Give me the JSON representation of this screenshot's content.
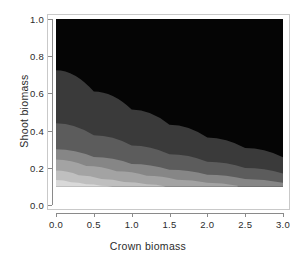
{
  "figure": {
    "background": "#ffffff",
    "panel_border_color": "#c9c9c9",
    "axis_color": "#8a8a8a",
    "text_color": "#2b2b2b"
  },
  "axes": {
    "x": {
      "title": "Crown biomass",
      "ticks": [
        "0.0",
        "0.5",
        "1.0",
        "1.5",
        "2.0",
        "2.5",
        "3.0"
      ],
      "tick_values": [
        0.0,
        0.5,
        1.0,
        1.5,
        2.0,
        2.5,
        3.0
      ],
      "range": [
        0.0,
        3.0
      ]
    },
    "y": {
      "title": "Shoot biomass",
      "ticks": [
        "0.0",
        "0.2",
        "0.4",
        "0.6",
        "0.8",
        "1.0"
      ],
      "tick_values": [
        0.0,
        0.2,
        0.4,
        0.6,
        0.8,
        1.0
      ],
      "range": [
        0.0,
        1.0
      ]
    }
  },
  "chart_data": {
    "type": "heatmap",
    "title": "",
    "xlabel": "Crown biomass",
    "ylabel": "Shoot biomass",
    "xlim": [
      0.0,
      3.0
    ],
    "ylim": [
      0.0,
      1.0
    ],
    "grid": false,
    "legend": "none",
    "colormap": "grayscale",
    "colormap_direction": "light-low-left to black-high-right",
    "data_extent": {
      "x": [
        0.0,
        3.0
      ],
      "y": [
        0.1,
        1.0
      ],
      "note": "shaded image region does not reach y=0; blank white strip below y=0.1"
    },
    "contour_levels": [
      {
        "index": 0,
        "color": "#d9d9d9",
        "label": "lightest band (lower-left corner)"
      },
      {
        "index": 1,
        "color": "#bfbfbf",
        "label": "light gray band"
      },
      {
        "index": 2,
        "color": "#a3a3a3",
        "label": "medium-light gray band"
      },
      {
        "index": 3,
        "color": "#868686",
        "label": "medium gray band"
      },
      {
        "index": 4,
        "color": "#5c5c5c",
        "label": "dark gray band"
      },
      {
        "index": 5,
        "color": "#3a3a3a",
        "label": "darker gray band"
      },
      {
        "index": 6,
        "color": "#050505",
        "label": "black region (upper right, dominant)"
      }
    ],
    "band_boundaries_hyperbolic": [
      {
        "level": 0,
        "k": 0.022,
        "y_at_x0": 0.135,
        "description": "boundary between lightest and next band"
      },
      {
        "level": 1,
        "k": 0.06,
        "y_at_x0": 0.185,
        "description": "boundary of light gray band"
      },
      {
        "level": 2,
        "k": 0.135,
        "y_at_x0": 0.245,
        "description": "boundary of medium-light band"
      },
      {
        "level": 3,
        "k": 0.27,
        "y_at_x0": 0.3,
        "description": "boundary of medium gray band"
      },
      {
        "level": 4,
        "k": 0.6,
        "y_at_x0": 0.44,
        "description": "boundary of dark gray band"
      },
      {
        "level": 5,
        "k": 1.25,
        "y_at_x0": 0.725,
        "description": "boundary of darker gray band into black"
      }
    ],
    "boundary_samples": {
      "description": "approximate (x,y) points tracing each band boundary from left edge to where it exits the panel",
      "level_0": [
        [
          0.0,
          0.135
        ],
        [
          0.2,
          0.122
        ],
        [
          0.4,
          0.112
        ],
        [
          0.6,
          0.104
        ],
        [
          0.75,
          0.1
        ]
      ],
      "level_1": [
        [
          0.0,
          0.185
        ],
        [
          0.3,
          0.16
        ],
        [
          0.6,
          0.14
        ],
        [
          0.9,
          0.124
        ],
        [
          1.2,
          0.111
        ],
        [
          1.45,
          0.1
        ]
      ],
      "level_2": [
        [
          0.0,
          0.245
        ],
        [
          0.4,
          0.21
        ],
        [
          0.8,
          0.181
        ],
        [
          1.2,
          0.157
        ],
        [
          1.6,
          0.136
        ],
        [
          2.0,
          0.119
        ],
        [
          2.4,
          0.104
        ]
      ],
      "level_3": [
        [
          0.0,
          0.3
        ],
        [
          0.5,
          0.258
        ],
        [
          1.0,
          0.221
        ],
        [
          1.5,
          0.19
        ],
        [
          2.0,
          0.163
        ],
        [
          2.5,
          0.14
        ],
        [
          3.0,
          0.12
        ]
      ],
      "level_4": [
        [
          0.0,
          0.44
        ],
        [
          0.5,
          0.375
        ],
        [
          1.0,
          0.32
        ],
        [
          1.5,
          0.273
        ],
        [
          2.0,
          0.233
        ],
        [
          2.5,
          0.199
        ],
        [
          3.0,
          0.17
        ]
      ],
      "level_5": [
        [
          0.0,
          0.725
        ],
        [
          0.5,
          0.61
        ],
        [
          1.0,
          0.513
        ],
        [
          1.5,
          0.432
        ],
        [
          2.0,
          0.363
        ],
        [
          2.5,
          0.306
        ],
        [
          3.0,
          0.257
        ]
      ]
    }
  }
}
